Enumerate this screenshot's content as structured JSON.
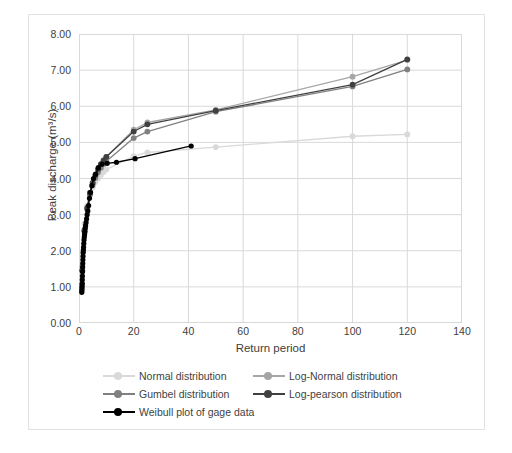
{
  "chart_data": {
    "type": "line",
    "title": "",
    "xlabel": "Return period",
    "ylabel": "Peak discharge (m³/s)",
    "xlim": [
      0,
      140
    ],
    "ylim": [
      0,
      8
    ],
    "xticks": [
      "0",
      "20",
      "40",
      "60",
      "80",
      "100",
      "120",
      "140"
    ],
    "yticks": [
      "0.00",
      "1.00",
      "2.00",
      "3.00",
      "4.00",
      "5.00",
      "6.00",
      "7.00",
      "8.00"
    ],
    "grid": true,
    "legend_position": "bottom",
    "series": [
      {
        "name": "Normal distribution",
        "color": "#d9d9d9",
        "marker": "circle",
        "x": [
          1.2,
          2,
          3,
          4,
          5,
          6,
          7,
          8,
          9,
          10,
          20,
          25,
          50,
          100,
          120
        ],
        "y": [
          1.95,
          2.75,
          3.25,
          3.55,
          3.75,
          3.9,
          4.0,
          4.1,
          4.18,
          4.25,
          4.62,
          4.72,
          4.87,
          5.17,
          5.22
        ]
      },
      {
        "name": "Log-Normal distribution",
        "color": "#a6a6a6",
        "marker": "circle",
        "x": [
          1.2,
          2,
          3,
          4,
          5,
          6,
          7,
          8,
          9,
          10,
          20,
          25,
          50,
          100,
          120
        ],
        "y": [
          1.55,
          2.6,
          3.2,
          3.6,
          3.88,
          4.08,
          4.25,
          4.38,
          4.5,
          4.6,
          5.35,
          5.55,
          5.9,
          6.82,
          7.28
        ]
      },
      {
        "name": "Gumbel distribution",
        "color": "#808080",
        "marker": "circle",
        "x": [
          1.2,
          2,
          3,
          4,
          5,
          6,
          7,
          8,
          9,
          10,
          20,
          25,
          50,
          100,
          120
        ],
        "y": [
          1.45,
          2.55,
          3.15,
          3.55,
          3.82,
          4.02,
          4.18,
          4.3,
          4.4,
          4.48,
          5.12,
          5.3,
          5.85,
          6.55,
          7.02
        ]
      },
      {
        "name": "Log-pearson distribution",
        "color": "#404040",
        "marker": "circle",
        "x": [
          1.2,
          2,
          3,
          4,
          5,
          6,
          7,
          8,
          9,
          10,
          20,
          25,
          50,
          100,
          120
        ],
        "y": [
          1.45,
          2.55,
          3.18,
          3.6,
          3.88,
          4.1,
          4.26,
          4.4,
          4.5,
          4.6,
          5.3,
          5.5,
          5.88,
          6.6,
          7.3
        ]
      },
      {
        "name": "Weibull plot of gage data",
        "color": "#000000",
        "marker": "circle",
        "x": [
          1.02,
          1.05,
          1.07,
          1.1,
          1.13,
          1.17,
          1.2,
          1.24,
          1.28,
          1.32,
          1.37,
          1.42,
          1.47,
          1.53,
          1.6,
          1.67,
          1.75,
          1.83,
          1.93,
          2.03,
          2.15,
          2.28,
          2.42,
          2.58,
          2.77,
          2.98,
          3.22,
          3.5,
          3.83,
          4.22,
          4.7,
          5.3,
          6.05,
          7.05,
          8.4,
          10.3,
          13.7,
          20.5,
          41.0
        ],
        "y": [
          0.85,
          0.9,
          0.95,
          1.0,
          1.05,
          1.1,
          1.2,
          1.3,
          1.42,
          1.55,
          1.65,
          1.75,
          1.85,
          1.95,
          2.02,
          2.1,
          2.2,
          2.3,
          2.38,
          2.45,
          2.52,
          2.62,
          2.7,
          2.78,
          2.88,
          3.0,
          3.1,
          3.25,
          3.45,
          3.62,
          3.8,
          4.0,
          4.12,
          4.3,
          4.4,
          4.42,
          4.45,
          4.55,
          4.9
        ]
      }
    ]
  },
  "legend": {
    "rows": [
      [
        {
          "label": "Normal distribution",
          "color": "#d9d9d9"
        },
        {
          "label": "Log-Normal distribution",
          "color": "#a6a6a6"
        }
      ],
      [
        {
          "label": "Gumbel distribution",
          "color": "#808080"
        },
        {
          "label": "Log-pearson distribution",
          "color": "#404040"
        }
      ],
      [
        {
          "label": "Weibull plot of gage data",
          "color": "#000000"
        }
      ]
    ]
  },
  "caption": ""
}
